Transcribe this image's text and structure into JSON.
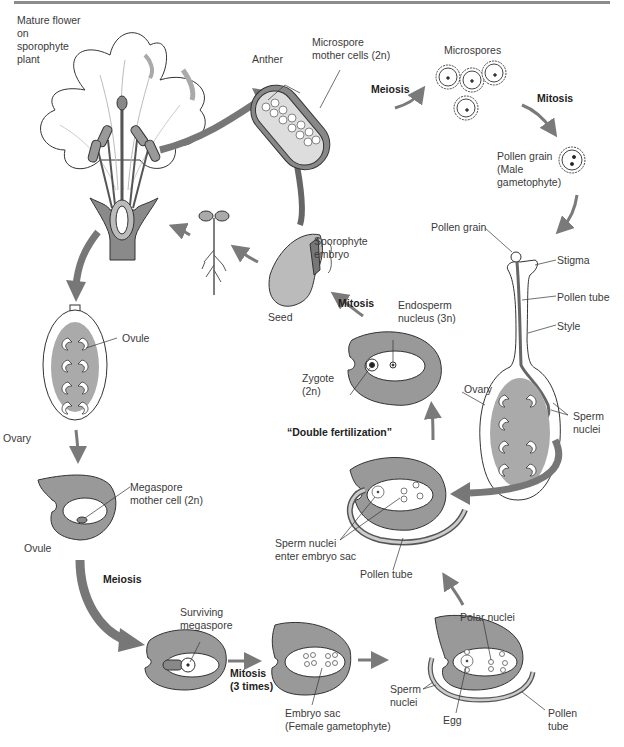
{
  "diagram": {
    "colors": {
      "arrow": "#7a7a7a",
      "tissue": "#9a9a9a",
      "light_fill": "#c8c8c8",
      "outline": "#333333"
    },
    "stages": {
      "flower": {
        "label": "Mature flower\non\nsporophyte\nplant"
      },
      "anther": {
        "label_anther": "Anther",
        "label_mother": "Microspore\nmother cells (2n)"
      },
      "step_meiosis_male": "Meiosis",
      "microspores": {
        "label": "Microspores"
      },
      "step_mitosis_male": "Mitosis",
      "pollen": {
        "label": "Pollen grain\n(Male\ngametophyte)"
      },
      "pistil": {
        "pollen_grain": "Pollen grain",
        "stigma": "Stigma",
        "pollen_tube": "Pollen tube",
        "style": "Style",
        "ovary": "Ovary",
        "sperm_nuclei": "Sperm\nnuclei"
      },
      "fertilization_ovule": {
        "sperm_nuclei": "Sperm\nnuclei",
        "egg": "Egg",
        "polar_nuclei": "Polar nuclei",
        "pollen_tube": "Pollen\ntube"
      },
      "double_fertilization": {
        "label": "“Double fertilization”",
        "sperm_enter": "Sperm nuclei\nenter embryo sac",
        "pollen_tube": "Pollen tube"
      },
      "zygote": {
        "zygote": "Zygote\n(2n)",
        "endosperm": "Endosperm\nnucleus (3n)"
      },
      "step_mitosis_seed": "Mitosis",
      "seed": {
        "seed": "Seed",
        "embryo": "Sporophyte\nembryo"
      },
      "ovary_left": {
        "ovule": "Ovule",
        "ovary": "Ovary"
      },
      "megaspore_ovule": {
        "label": "Megaspore\nmother cell (2n)",
        "ovule": "Ovule"
      },
      "step_meiosis_female": "Meiosis",
      "surviving": {
        "label": "Surviving\nmegaspore"
      },
      "step_mitosis_3": "Mitosis\n(3 times)",
      "embryo_sac": {
        "label": "Embryo sac\n(Female gametophyte)"
      }
    }
  }
}
